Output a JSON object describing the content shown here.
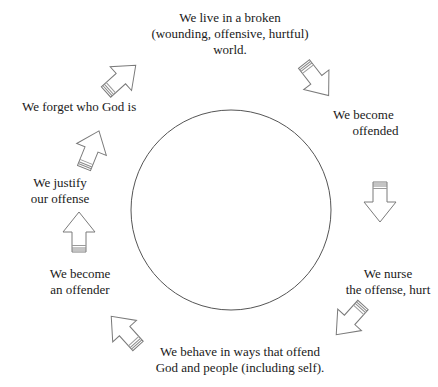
{
  "diagram": {
    "type": "cycle",
    "center_circle": {
      "cx": 231,
      "cy": 210,
      "r": 100,
      "stroke": "#555555"
    },
    "arrow_style": {
      "stroke": "#777777",
      "fill": "#ffffff",
      "band": "#888888"
    },
    "stages": [
      {
        "id": "broken-world",
        "text": "We live in a broken\n(wounding, offensive, hurtful)\nworld."
      },
      {
        "id": "become-offended",
        "text": "We become\n      offended"
      },
      {
        "id": "nurse-offense",
        "text": "We nurse\nthe offense, hurt"
      },
      {
        "id": "behave-offensively",
        "text": "We behave in ways that offend\nGod and people (including self)."
      },
      {
        "id": "become-offender",
        "text": "We become\nan offender"
      },
      {
        "id": "justify-offense",
        "text": "We justify\nour offense"
      },
      {
        "id": "forget-god",
        "text": "We forget who God is"
      }
    ],
    "arrows": [
      {
        "id": "arrow-forget-to-world",
        "direction": "up-right"
      },
      {
        "id": "arrow-world-to-offended",
        "direction": "down-right"
      },
      {
        "id": "arrow-offended-to-nurse",
        "direction": "down"
      },
      {
        "id": "arrow-nurse-to-behave",
        "direction": "down-left"
      },
      {
        "id": "arrow-behave-to-offender",
        "direction": "up-left"
      },
      {
        "id": "arrow-offender-to-justify",
        "direction": "up"
      },
      {
        "id": "arrow-justify-to-forget",
        "direction": "up-right"
      }
    ]
  }
}
